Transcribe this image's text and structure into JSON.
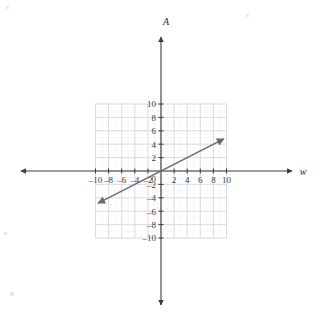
{
  "figure": {
    "kind": "coordinate-plane-graph",
    "background_color": "#ffffff",
    "axis_color": "#3a3a3a",
    "grid_minor_color": "#e8e8ee",
    "grid_major_color": "#d8d8e2",
    "line_color": "#6b6b6b"
  },
  "axes": {
    "x": {
      "name": "w",
      "min": -10,
      "max": 10,
      "tick_step": 2,
      "tick_labels": [
        "–10",
        "–8",
        "–6",
        "–4",
        "–2",
        "0",
        "2",
        "4",
        "6",
        "8",
        "10"
      ],
      "tick_values": [
        -10,
        -8,
        -6,
        -4,
        -2,
        0,
        2,
        4,
        6,
        8,
        10
      ],
      "arrow_both_ends": true
    },
    "y": {
      "name": "A",
      "min": -10,
      "max": 10,
      "tick_step": 2,
      "tick_labels": [
        "10",
        "8",
        "6",
        "4",
        "2",
        "–2",
        "–4",
        "–6",
        "–8",
        "–10"
      ],
      "tick_values": [
        10,
        8,
        6,
        4,
        2,
        -2,
        -4,
        -6,
        -8,
        -10
      ],
      "arrow_both_ends": true
    },
    "origin_label": "0"
  },
  "chart_data": {
    "type": "line",
    "title": "",
    "xlabel": "w",
    "ylabel": "A",
    "xlim": [
      -10,
      10
    ],
    "ylim": [
      -10,
      10
    ],
    "grid": true,
    "legend": "none",
    "series": [
      {
        "name": "A = 0.5w",
        "slope": 0.5,
        "intercept": 0,
        "color": "#6b6b6b",
        "arrows": "both",
        "x": [
          -9.6,
          -8,
          -6,
          -4,
          -2,
          0,
          2,
          4,
          6,
          8,
          9.6
        ],
        "values": [
          -4.8,
          -4,
          -3,
          -2,
          -1,
          0,
          1,
          2,
          3,
          4,
          4.8
        ],
        "endpoints": {
          "start": [
            -9.6,
            -4.8
          ],
          "end": [
            9.6,
            4.8
          ]
        }
      }
    ]
  }
}
